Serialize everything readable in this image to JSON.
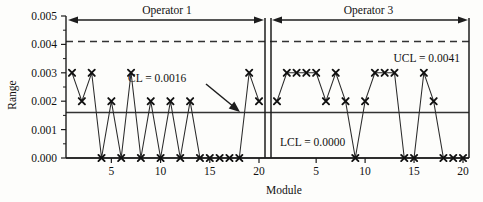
{
  "chart_data": {
    "type": "line",
    "title": "",
    "xlabel": "Module",
    "ylabel": "Range",
    "ylim": [
      0.0,
      0.005
    ],
    "ytick_labels": [
      "0.000",
      "0.001",
      "0.002",
      "0.003",
      "0.004",
      "0.005"
    ],
    "ytick_values": [
      0.0,
      0.001,
      0.002,
      0.003,
      0.004,
      0.005
    ],
    "y_minor_step": 0.0005,
    "grid": false,
    "legend": "none",
    "marker": "x",
    "panels": [
      {
        "name": "Operator 1",
        "xtick_labels": [
          "5",
          "10",
          "15",
          "20"
        ],
        "xtick_values": [
          5,
          10,
          15,
          20
        ],
        "x": [
          1,
          2,
          3,
          4,
          5,
          6,
          7,
          8,
          9,
          10,
          11,
          12,
          13,
          14,
          15,
          16,
          17,
          18,
          19,
          20
        ],
        "values": [
          0.003,
          0.002,
          0.003,
          0.0,
          0.002,
          0.0,
          0.003,
          0.0,
          0.002,
          0.0,
          0.002,
          0.0,
          0.002,
          0.0,
          0.0,
          0.0,
          0.0,
          0.0,
          0.003,
          0.002
        ]
      },
      {
        "name": "Operator 3",
        "xtick_labels": [
          "5",
          "10",
          "15",
          "20"
        ],
        "xtick_values": [
          5,
          10,
          15,
          20
        ],
        "x": [
          1,
          2,
          3,
          4,
          5,
          6,
          7,
          8,
          9,
          10,
          11,
          12,
          13,
          14,
          15,
          16,
          17,
          18,
          19,
          20
        ],
        "values": [
          0.002,
          0.003,
          0.003,
          0.003,
          0.003,
          0.002,
          0.003,
          0.002,
          0.0,
          0.002,
          0.003,
          0.003,
          0.003,
          0.0,
          0.0,
          0.003,
          0.002,
          0.0,
          0.0,
          0.0
        ]
      }
    ],
    "control_limits": [
      {
        "key": "ucl",
        "label": "UCL = 0.0041",
        "value": 0.0041,
        "style": "dashed"
      },
      {
        "key": "cl",
        "label": "CL = 0.0016",
        "value": 0.0016,
        "style": "solid"
      },
      {
        "key": "lcl",
        "label": "LCL = 0.0000",
        "value": 0.0,
        "style": "solid"
      }
    ],
    "annotations": [
      {
        "key": "operator1_span",
        "text": "Operator 1"
      },
      {
        "key": "operator3_span",
        "text": "Operator 3"
      },
      {
        "key": "cl_callout",
        "text": "CL = 0.0016"
      },
      {
        "key": "ucl_callout",
        "text": "UCL = 0.0041"
      },
      {
        "key": "lcl_callout",
        "text": "LCL = 0.0000"
      }
    ]
  },
  "axes": {
    "y_title": "Range",
    "x_title": "Module",
    "y_labels": [
      "0.005",
      "0.004",
      "0.003",
      "0.002",
      "0.001",
      "0.000"
    ],
    "x_labels_panel1": [
      "5",
      "10",
      "15",
      "20"
    ],
    "x_labels_panel2": [
      "5",
      "10",
      "15",
      "20"
    ]
  },
  "annotations": {
    "operator1": "Operator 1",
    "operator3": "Operator 3",
    "cl": "CL = 0.0016",
    "ucl": "UCL = 0.0041",
    "lcl": "LCL = 0.0000"
  },
  "colors": {
    "ink": "#1a1a1a",
    "line": "#2a2a2a",
    "limit": "#333333",
    "background": "#fdfdfb"
  }
}
